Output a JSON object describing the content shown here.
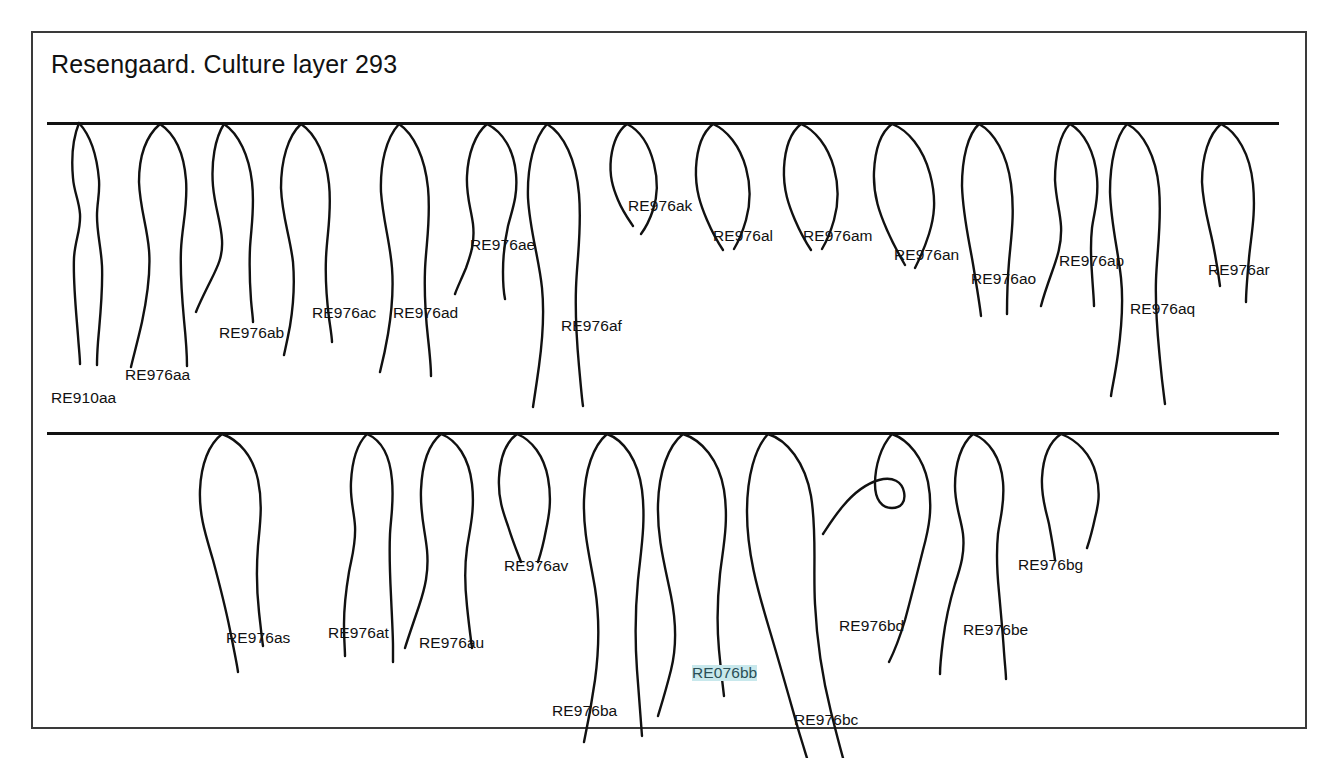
{
  "figure": {
    "title": "Resengaard. Culture layer 293",
    "type": "archaeological-pottery-rim-profile-plate",
    "frame_color": "#3a3a3a",
    "ink_color": "#111111",
    "background_color": "#ffffff",
    "highlight_color": "#c8e8ec",
    "baselines": [
      {
        "name": "row-1-rim-line",
        "y": 89
      },
      {
        "name": "row-2-rim-line",
        "y": 399
      }
    ]
  },
  "rows": [
    {
      "name": "row-1",
      "profiles": [
        {
          "id": "RE910aa",
          "label": "RE910aa",
          "label_x": 18,
          "label_y": 357,
          "highlighted": false
        },
        {
          "id": "RE976aa",
          "label": "RE976aa",
          "label_x": 92,
          "label_y": 334,
          "highlighted": false
        },
        {
          "id": "RE976ab",
          "label": "RE976ab",
          "label_x": 186,
          "label_y": 292,
          "highlighted": false
        },
        {
          "id": "RE976ac",
          "label": "RE976ac",
          "label_x": 279,
          "label_y": 272,
          "highlighted": false
        },
        {
          "id": "RE976ad",
          "label": "RE976ad",
          "label_x": 360,
          "label_y": 272,
          "highlighted": false
        },
        {
          "id": "RE976ae",
          "label": "RE976ae",
          "label_x": 437,
          "label_y": 204,
          "highlighted": false
        },
        {
          "id": "RE976af",
          "label": "RE976af",
          "label_x": 528,
          "label_y": 285,
          "highlighted": false
        },
        {
          "id": "RE976ak",
          "label": "RE976ak",
          "label_x": 595,
          "label_y": 165,
          "highlighted": false
        },
        {
          "id": "RE976al",
          "label": "RE976al",
          "label_x": 680,
          "label_y": 195,
          "highlighted": false
        },
        {
          "id": "RE976am",
          "label": "RE976am",
          "label_x": 770,
          "label_y": 195,
          "highlighted": false
        },
        {
          "id": "RE976an",
          "label": "RE976an",
          "label_x": 861,
          "label_y": 214,
          "highlighted": false
        },
        {
          "id": "RE976ao",
          "label": "RE976ao",
          "label_x": 938,
          "label_y": 238,
          "highlighted": false
        },
        {
          "id": "RE976ap",
          "label": "RE976ap",
          "label_x": 1026,
          "label_y": 220,
          "highlighted": false
        },
        {
          "id": "RE976aq",
          "label": "RE976aq",
          "label_x": 1097,
          "label_y": 268,
          "highlighted": false
        },
        {
          "id": "RE976ar",
          "label": "RE976ar",
          "label_x": 1175,
          "label_y": 229,
          "highlighted": false
        }
      ]
    },
    {
      "name": "row-2",
      "profiles": [
        {
          "id": "RE976as",
          "label": "RE976as",
          "label_x": 193,
          "label_y": 597,
          "highlighted": false
        },
        {
          "id": "RE976at",
          "label": "RE976at",
          "label_x": 295,
          "label_y": 592,
          "highlighted": false
        },
        {
          "id": "RE976au",
          "label": "RE976au",
          "label_x": 386,
          "label_y": 602,
          "highlighted": false
        },
        {
          "id": "RE976av",
          "label": "RE976av",
          "label_x": 471,
          "label_y": 525,
          "highlighted": false
        },
        {
          "id": "RE976ba",
          "label": "RE976ba",
          "label_x": 519,
          "label_y": 670,
          "highlighted": false
        },
        {
          "id": "RE076bb",
          "label": "RE076bb",
          "label_x": 659,
          "label_y": 632,
          "highlighted": true
        },
        {
          "id": "RE976bc",
          "label": "RE976bc",
          "label_x": 761,
          "label_y": 679,
          "highlighted": false
        },
        {
          "id": "RE976bd",
          "label": "RE976bd",
          "label_x": 806,
          "label_y": 585,
          "highlighted": false
        },
        {
          "id": "RE976be",
          "label": "RE976be",
          "label_x": 930,
          "label_y": 589,
          "highlighted": false
        },
        {
          "id": "RE976bg",
          "label": "RE976bg",
          "label_x": 985,
          "label_y": 524,
          "highlighted": false
        }
      ]
    }
  ],
  "geometry": {
    "row1_paths": [
      "M 32 1 C 26 16 24 34 26 56 C 27 70 32 78 33 92 C 34 108 28 118 27 136 C 26 160 29 188 31 214 C 32 228 33 236 33 242",
      "M 32 1 C 44 14 50 34 52 58 C 53 72 50 80 50 94 C 50 112 54 124 55 144 C 56 170 53 196 51 220 C 50 234 50 238 50 243",
      "M 113 2 C 99 14 92 34 92 60 C 93 86 100 104 102 128 C 104 152 100 176 95 200 C 90 222 86 236 84 245",
      "M 113 2 C 128 12 137 32 139 58 C 141 84 135 104 134 128 C 133 152 135 176 137 198 C 139 218 140 232 140 244",
      "M 177 2 C 168 16 164 40 166 64 C 168 86 174 100 175 118 C 176 134 171 144 164 158 C 157 172 152 182 149 190",
      "M 177 2 C 192 12 202 34 205 60 C 208 86 204 106 203 126 C 202 148 203 164 204 178 C 205 190 206 196 206 200",
      "M 254 2 C 241 14 234 38 234 66 C 235 94 243 114 246 140 C 248 164 246 186 243 204 C 240 220 238 228 237 233",
      "M 254 2 C 269 12 279 34 282 62 C 285 90 280 112 279 136 C 278 160 280 180 282 196 C 284 210 285 216 285 220",
      "M 352 2 C 339 16 333 42 334 70 C 336 98 343 120 345 146 C 347 172 344 194 341 212 C 338 230 335 242 333 250",
      "M 352 2 C 367 12 378 36 381 66 C 384 98 379 122 378 148 C 377 176 379 198 381 216 C 383 234 384 246 384 254",
      "M 440 2 C 428 12 421 32 420 54 C 419 74 424 86 426 102 C 428 120 424 132 419 146 C 414 158 410 166 408 172",
      "M 440 2 C 456 10 467 28 469 52 C 471 74 465 88 461 104 C 457 122 456 136 456 150 C 456 164 457 172 458 177",
      "M 500 2 C 487 16 480 44 481 76 C 483 110 492 136 495 166 C 498 196 495 222 492 244 C 489 266 487 278 486 285",
      "M 500 2 C 517 12 529 38 532 72 C 535 108 530 136 529 166 C 528 196 530 222 532 244 C 534 266 535 278 536 284",
      "M 580 2 C 572 8 566 20 564 36 C 562 54 566 66 571 78 C 576 90 582 98 586 104",
      "M 580 2 C 592 8 602 22 607 42 C 612 62 610 76 606 88 C 602 100 597 108 594 112",
      "M 666 2 C 656 10 650 26 649 46 C 648 68 654 84 660 98 C 666 112 672 122 676 128",
      "M 666 2 C 680 8 693 24 699 46 C 705 68 703 84 699 98 C 695 112 690 122 687 127",
      "M 754 2 C 744 10 738 26 737 46 C 736 68 742 84 748 98 C 754 112 760 122 764 128",
      "M 754 2 C 768 8 781 24 787 46 C 793 68 791 84 787 98 C 783 112 778 122 775 127",
      "M 845 2 C 834 10 828 28 827 50 C 826 74 833 92 840 108 C 847 124 854 136 858 143",
      "M 845 2 C 861 8 876 26 883 52 C 890 78 887 96 882 112 C 877 128 871 140 868 146",
      "M 932 2 C 921 12 915 36 915 64 C 916 94 922 118 926 142 C 930 166 933 184 934 194",
      "M 932 2 C 947 10 960 32 964 62 C 968 92 964 116 962 140 C 960 164 960 182 960 192",
      "M 1023 2 C 1013 12 1008 34 1008 58 C 1009 78 1013 88 1014 104 C 1015 122 1010 136 1005 150 C 1000 164 996 176 994 184",
      "M 1023 2 C 1037 10 1048 30 1050 56 C 1052 78 1047 90 1045 106 C 1043 124 1044 138 1045 152 C 1046 168 1047 178 1047 184",
      "M 1080 2 C 1069 14 1063 40 1063 70 C 1064 102 1071 128 1074 156 C 1077 184 1074 210 1071 232 C 1068 254 1065 266 1064 274",
      "M 1080 2 C 1096 10 1109 34 1112 66 C 1115 100 1110 128 1109 158 C 1108 190 1111 216 1113 238 C 1115 260 1117 274 1118 282",
      "M 1174 2 C 1162 12 1155 34 1155 60 C 1156 84 1162 102 1166 122 C 1170 142 1172 156 1173 164",
      "M 1174 2 C 1190 10 1203 32 1206 62 C 1209 92 1204 114 1202 136 C 1200 158 1199 172 1199 180"
    ],
    "row2_paths": [
      "M 175 2 C 162 12 154 32 153 58 C 152 84 159 104 166 128 C 173 154 179 178 183 198 C 187 218 190 232 191 240",
      "M 175 2 C 192 8 206 24 211 48 C 216 72 213 92 211 114 C 209 140 210 162 212 180 C 214 198 215 208 216 214",
      "M 320 2 C 310 12 305 30 304 50 C 303 68 307 78 308 94 C 309 112 305 124 302 140 C 299 158 297 176 297 192 C 297 208 298 218 298 224",
      "M 320 2 C 334 8 343 24 345 48 C 347 70 344 84 343 102 C 342 124 343 144 344 164 C 345 186 346 204 346 214 C 346 222 346 226 346 230",
      "M 394 2 C 382 12 375 32 374 58 C 373 82 378 98 380 118 C 382 140 378 156 372 174 C 366 192 361 206 358 216",
      "M 394 2 C 410 8 422 26 425 52 C 428 78 423 96 420 116 C 417 138 418 156 420 174 C 422 194 424 208 425 216",
      "M 470 2 C 459 10 453 26 452 46 C 451 66 456 80 461 94 C 466 110 471 122 474 130",
      "M 470 2 C 485 8 497 24 501 46 C 505 68 502 84 499 98 C 496 114 493 124 491 130",
      "M 560 2 C 546 14 538 38 537 68 C 536 100 543 126 548 156 C 553 188 552 218 548 248 C 544 276 540 296 537 310",
      "M 560 2 C 577 8 591 28 595 58 C 599 90 594 118 591 148 C 588 180 588 210 590 238 C 592 266 594 290 595 304",
      "M 636 2 C 621 14 612 40 611 72 C 610 106 618 134 624 164 C 630 194 629 218 624 238 C 619 258 614 274 611 284",
      "M 636 2 C 655 8 672 28 677 58 C 682 90 676 116 673 142 C 670 170 670 196 672 218 C 674 240 676 256 677 264",
      "M 721 2 C 708 16 700 44 700 80 C 700 120 710 156 722 196 C 734 236 744 272 752 300 C 760 326 766 346 770 358",
      "M 721 2 C 740 8 758 30 764 64 C 770 100 766 136 768 172 C 770 212 776 248 784 280 C 792 312 798 334 802 346",
      "M 845 2 C 834 14 828 34 828 52 C 828 68 835 76 845 76 C 854 76 859 70 857 60 C 855 50 846 44 832 48 C 818 52 806 62 796 74 C 786 86 780 96 776 102",
      "M 845 2 C 862 8 876 26 881 50 C 886 76 882 96 876 118 C 870 142 864 166 858 188 C 852 208 846 222 842 230",
      "M 926 2 C 914 12 908 32 908 54 C 908 74 914 86 916 102 C 918 120 914 134 908 152 C 902 172 898 192 896 208 C 894 224 893 236 893 242",
      "M 926 2 C 942 8 954 26 956 50 C 958 72 953 86 951 102 C 949 122 950 140 952 160 C 954 182 956 204 957 220 C 958 234 959 242 959 247",
      "M 1014 2 C 1002 10 996 26 995 46 C 994 66 999 78 1002 92 C 1005 108 1007 120 1008 128",
      "M 1014 2 C 1030 8 1044 22 1049 42 C 1054 62 1051 74 1048 86 C 1045 100 1042 110 1040 116"
    ]
  }
}
